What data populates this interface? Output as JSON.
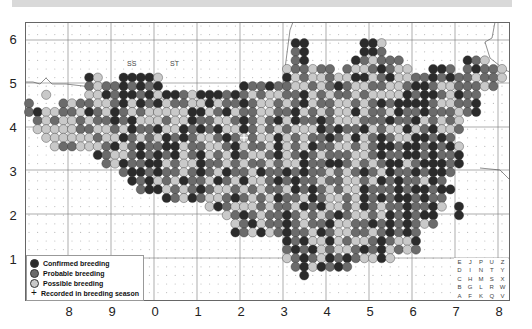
{
  "map": {
    "grid_squares": [
      "SS",
      "ST"
    ],
    "y_axis_labels": [
      "6",
      "5",
      "4",
      "3",
      "2",
      "1"
    ],
    "x_axis_labels": [
      "8",
      "9",
      "0",
      "1",
      "2",
      "3",
      "4",
      "5",
      "6",
      "7",
      "8"
    ],
    "colors": {
      "confirmed": "#2b2b2b",
      "probable": "#6b6b6b",
      "possible": "#c9c9c9",
      "grid": "#777777",
      "dots": "#bbbbbb"
    },
    "dot_rows": [
      "........................................................",
      "........................................................",
      "...............................CC......CCS..............",
      "...............................PC......CCP..............",
      "...............................PC.....CPSPPP.......CPS..",
      "..............................SPPSPP.PSSPCPSS..CCP.PCPPS",
      ".......CS..CCCCS..............CSPSSPSSCCSPCSSPPCPCPPSPPS",
      ".......PSPPCPCPC.........CPPCPPSSPSPCPSSPPSSPCCPSSPPPSP.",
      "..S....SSCPCCPCSCCPSCCCPCPSPSSPPCSPSPPSPSSSSCPCCPSCPP...",
      "P...PSPPSSPCSCPCSPPSSCSPPCPSSPSPCSPPSSPSPCPCCCCPSSPPC...",
      "PCSSPPSCPSCPSPSSSSSCCSPCSPPSSPPCSPSPSSCSPPSCPPCPPPSPC...",
      ".PSPSSPSPPCPCSSSPSSCPPSSPCPSPCSCPPCPSSSPPPCPPCSPSPS.....",
      ".SSSSSPPSSPSCPPCSSCPCPCSSCPSPSPSSSCPCPPCSPSSCSPCSSP.....",
      "..SSSSSSPSSCPSPSCPCPSSPCPSPSSCSPSPPCPSCSPCPSSCCPCP......",
      "...SPPSSSPCSPCPPCCSPPSSPCSPPSCSPSCPPSSPSPCCPCCPCPCS.....",
      "........CPSSPCPCPCSPCSPSCPSSPCSPCPSPPPSSPCPPCCPCPPC.....",
      ".........PSCPPCCSPSSCPPSPSPPSPSSCPPCCPSPSPCCSPCCCPC.....",
      "...........PCCPCPPSPCPSCPPSCPPCPCPPSPSPCPSCPPCPCCP......",
      "............CPCSPSCPPSCPSCSSPCPCPPSPPSSPSCPCPPSCP.......",
      ".............PCCSPSPCPSSPSPSPPSCPCPSPSSCPPPCPCCPCC......",
      "................CPSCPSSPCPSPSCPPSCPSSPSCPCPCCPCPP.......",
      ".....................SCPSSSPSPPSCPCSSPSCPSPPCPPCS.C.....",
      ".......................SPCPSPPCPSPSPCPSSPSCPCPCC..C.....",
      "........................SPCSPPCPSPPCSSPPCPCPCPSP........",
      "........................CPSCSPCPPSCPSSPPSPCPCP..........",
      "..............................CPCSSCSPSSPCPSSC..........",
      "..............................PCPCSPSSPCPCSPSP..........",
      "..............................SPCPSCPCPSSCS.............",
      "...............................PCSCPCP..................",
      "................................C.......................",
      "........................................................",
      "........................................................"
    ],
    "recorded_marks": [
      {
        "col": 25,
        "row": 13
      }
    ]
  },
  "legend": {
    "items": [
      {
        "label": "Confirmed breeding",
        "symbol": "confirmed"
      },
      {
        "label": "Probable breeding",
        "symbol": "probable"
      },
      {
        "label": "Possible breeding",
        "symbol": "possible"
      },
      {
        "label": "Recorded in breeding season",
        "symbol": "+"
      }
    ]
  },
  "tetrad_key": {
    "rows": [
      [
        "E",
        "J",
        "P",
        "U",
        "Z"
      ],
      [
        "D",
        "I",
        "N",
        "T",
        "Y"
      ],
      [
        "C",
        "H",
        "M",
        "S",
        "X"
      ],
      [
        "B",
        "G",
        "L",
        "R",
        "W"
      ],
      [
        "A",
        "F",
        "K",
        "Q",
        "V"
      ]
    ]
  }
}
